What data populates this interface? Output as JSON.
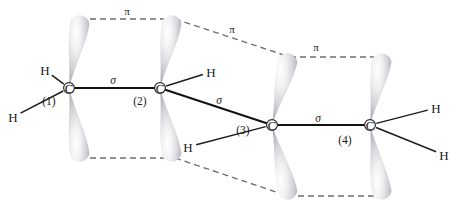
{
  "figure": {
    "background_color": "#ffffff",
    "line_color": "#1d1d1d",
    "dash_color": "#6e6e72",
    "lobe_color_light": "#ffffff",
    "lobe_color_mid": "#d8d8dc",
    "lobe_color_dark": "#a9a9ae"
  },
  "atoms": [
    {
      "id": "c1",
      "symbol": "C",
      "index": "(1)",
      "x": 69,
      "y": 88,
      "index_x": 49,
      "index_y": 101
    },
    {
      "id": "c2",
      "symbol": "C",
      "index": "(2)",
      "x": 160,
      "y": 88,
      "index_x": 140,
      "index_y": 101
    },
    {
      "id": "c3",
      "symbol": "C",
      "index": "(3)",
      "x": 272,
      "y": 125,
      "index_x": 243,
      "index_y": 130
    },
    {
      "id": "c4",
      "symbol": "C",
      "index": "(4)",
      "x": 370,
      "y": 125,
      "index_x": 345,
      "index_y": 140
    }
  ],
  "hydrogens": [
    {
      "id": "h1",
      "symbol": "H",
      "x": 45,
      "y": 70,
      "bond_to": "c1"
    },
    {
      "id": "h2",
      "symbol": "H",
      "x": 13,
      "y": 117,
      "bond_to": "c1"
    },
    {
      "id": "h3",
      "symbol": "H",
      "x": 211,
      "y": 72,
      "bond_to": "c2"
    },
    {
      "id": "h4",
      "symbol": "H",
      "x": 188,
      "y": 147,
      "bond_to": "c3"
    },
    {
      "id": "h5",
      "symbol": "H",
      "x": 436,
      "y": 108,
      "bond_to": "c4"
    },
    {
      "id": "h6",
      "symbol": "H",
      "x": 444,
      "y": 155,
      "bond_to": "c4"
    }
  ],
  "sigma_bonds": [
    {
      "id": "sigma-c1-c2",
      "label": "σ",
      "label_x": 113,
      "label_y": 80,
      "from": "c1",
      "to": "c2"
    },
    {
      "id": "sigma-c2-c3",
      "label": "σ",
      "label_x": 219,
      "label_y": 100,
      "from": "c2",
      "to": "c3"
    },
    {
      "id": "sigma-c3-c4",
      "label": "σ",
      "label_x": 318,
      "label_y": 118,
      "from": "c3",
      "to": "c4"
    }
  ],
  "pi_interactions": [
    {
      "id": "pi-c1-c2-top",
      "label": "π",
      "label_x": 127,
      "label_y": 11,
      "x1": 80,
      "y1": 19,
      "x2": 175,
      "y2": 19
    },
    {
      "id": "pi-c2-c3-top",
      "label": "π",
      "label_x": 232,
      "label_y": 29,
      "x1": 175,
      "y1": 19,
      "x2": 290,
      "y2": 57
    },
    {
      "id": "pi-c3-c4-top",
      "label": "π",
      "label_x": 316,
      "label_y": 47,
      "x1": 290,
      "y1": 57,
      "x2": 382,
      "y2": 57
    },
    {
      "id": "pi-c1-c2-bottom",
      "label": "",
      "label_x": 0,
      "label_y": 0,
      "x1": 80,
      "y1": 158,
      "x2": 175,
      "y2": 158
    },
    {
      "id": "pi-c2-c3-bottom",
      "label": "",
      "label_x": 0,
      "label_y": 0,
      "x1": 175,
      "y1": 158,
      "x2": 288,
      "y2": 196
    },
    {
      "id": "pi-c3-c4-bottom",
      "label": "",
      "label_x": 0,
      "label_y": 0,
      "x1": 288,
      "y1": 196,
      "x2": 382,
      "y2": 196
    }
  ],
  "orbital_lobes": [
    {
      "id": "lobe-c1-up",
      "atom": "c1",
      "direction": "up",
      "tip_x": 69,
      "tip_y": 88,
      "end_x": 80,
      "end_y": 22
    },
    {
      "id": "lobe-c1-down",
      "atom": "c1",
      "direction": "down",
      "tip_x": 69,
      "tip_y": 88,
      "end_x": 80,
      "end_y": 155
    },
    {
      "id": "lobe-c2-up",
      "atom": "c2",
      "direction": "up",
      "tip_x": 160,
      "tip_y": 88,
      "end_x": 172,
      "end_y": 22
    },
    {
      "id": "lobe-c2-down",
      "atom": "c2",
      "direction": "down",
      "tip_x": 160,
      "tip_y": 88,
      "end_x": 172,
      "end_y": 155
    },
    {
      "id": "lobe-c3-up",
      "atom": "c3",
      "direction": "up",
      "tip_x": 272,
      "tip_y": 125,
      "end_x": 288,
      "end_y": 60
    },
    {
      "id": "lobe-c3-down",
      "atom": "c3",
      "direction": "down",
      "tip_x": 272,
      "tip_y": 125,
      "end_x": 288,
      "end_y": 193
    },
    {
      "id": "lobe-c4-up",
      "atom": "c4",
      "direction": "up",
      "tip_x": 370,
      "tip_y": 125,
      "end_x": 382,
      "end_y": 60
    },
    {
      "id": "lobe-c4-down",
      "atom": "c4",
      "direction": "down",
      "tip_x": 370,
      "tip_y": 125,
      "end_x": 382,
      "end_y": 193
    }
  ]
}
